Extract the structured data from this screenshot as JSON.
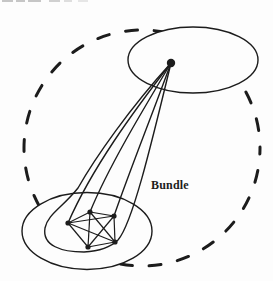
{
  "figure": {
    "label": "Bundle",
    "canvas": {
      "width": 273,
      "height": 281
    },
    "colors": {
      "ink": "#1c1c1c",
      "paper": "#fdfdfd",
      "artifact_gray": "#c6c6c6"
    }
  },
  "diagram": {
    "dashed_boundary": {
      "cx": 142,
      "cy": 148,
      "r": 118,
      "dash": "12 16.7",
      "width": 3
    },
    "top_ellipse": {
      "cx": 193,
      "cy": 60,
      "rx": 65,
      "ry": 33
    },
    "bottom_ellipse": {
      "cx": 87,
      "cy": 231,
      "rx": 65,
      "ry": 38.5
    },
    "hub_node": {
      "cx": 171,
      "cy": 63,
      "r": 4.2
    },
    "line_width": 1.4,
    "bundle_curves": [
      "M171,63 C130,108 95,158 78,188 C62,208 48,214 45,228 C42,246 62,252 84,252 C103,251 112,246 118,240 C132,224 150,150 171,63",
      "M171,63 C133,112 92,168 68,223",
      "M171,63 C141,113 108,168 90,212",
      "M171,63 C152,115 130,170 114,216"
    ],
    "cluster_nodes": [
      [
        90,
        212
      ],
      [
        68,
        223
      ],
      [
        114,
        216
      ],
      [
        115,
        242
      ],
      [
        88,
        247
      ]
    ],
    "cluster_edges": [
      [
        0,
        1
      ],
      [
        0,
        2
      ],
      [
        0,
        3
      ],
      [
        0,
        4
      ],
      [
        1,
        2
      ],
      [
        1,
        3
      ],
      [
        1,
        4
      ],
      [
        2,
        3
      ],
      [
        2,
        4
      ],
      [
        3,
        4
      ]
    ],
    "node_radius": 2.6,
    "edge_width": 1.2
  }
}
